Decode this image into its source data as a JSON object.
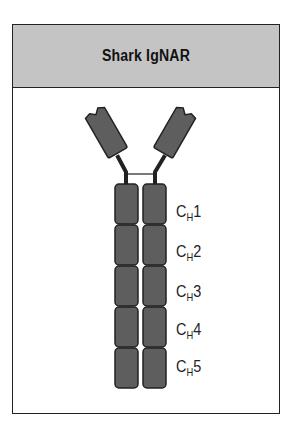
{
  "title": "Shark IgNAR",
  "colors": {
    "header_bg": "#c4c4c4",
    "domain_fill": "#5e5e5e",
    "outline": "#222222"
  },
  "domains": [
    {
      "base": "C",
      "sub": "H",
      "num": "1"
    },
    {
      "base": "C",
      "sub": "H",
      "num": "2"
    },
    {
      "base": "C",
      "sub": "H",
      "num": "3"
    },
    {
      "base": "C",
      "sub": "H",
      "num": "4"
    },
    {
      "base": "C",
      "sub": "H",
      "num": "5"
    }
  ],
  "variable_domains": [
    "left-v-domain",
    "right-v-domain"
  ]
}
